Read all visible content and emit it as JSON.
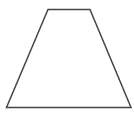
{
  "diagram": {
    "shape": "trapezoid",
    "stroke_color": "#454545",
    "fill_color": "#ffffff",
    "stroke_width": 1.5,
    "vertices": {
      "top_left": [
        48,
        9.5
      ],
      "top_right": [
        90,
        9.5
      ],
      "bottom_right": [
        131,
        107.5
      ],
      "bottom_left": [
        6.5,
        107.5
      ]
    },
    "points": "48,9.5 90,9.5 131,107.5 6.5,107.5"
  }
}
